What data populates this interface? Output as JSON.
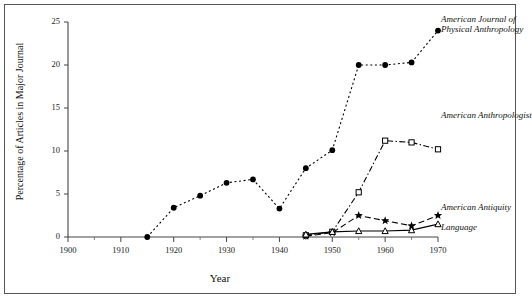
{
  "chart_data": {
    "type": "line",
    "title": "",
    "xlabel": "Year",
    "ylabel": "Percentage of Articles in Major Journal",
    "xlim": [
      1900,
      1970
    ],
    "ylim": [
      0,
      25
    ],
    "xticks": [
      1900,
      1910,
      1920,
      1930,
      1940,
      1950,
      1960,
      1970
    ],
    "xtick_labels": [
      "1900",
      "1910",
      "1920",
      "1930",
      "1940",
      "1950",
      "1960",
      "1970"
    ],
    "xminor_step": 5,
    "yticks": [
      0,
      5,
      10,
      15,
      20,
      25
    ],
    "ytick_labels": [
      "0",
      "5",
      "10",
      "15",
      "20",
      "25"
    ],
    "grid": false,
    "legend": "inline-right-labels",
    "series": [
      {
        "name": "American Journal of Physical Anthropology",
        "label_lines": [
          "American Journal of",
          "Physical Anthropology"
        ],
        "marker": "filled-circle",
        "linestyle": "dotted",
        "x": [
          1915,
          1920,
          1925,
          1930,
          1935,
          1940,
          1945,
          1950,
          1955,
          1960,
          1965,
          1970
        ],
        "y": [
          0,
          3.4,
          4.8,
          6.3,
          6.7,
          3.3,
          8.0,
          10.1,
          20.0,
          20.0,
          20.3,
          24.0
        ]
      },
      {
        "name": "American Anthropologist",
        "label_lines": [
          "American Anthropologist"
        ],
        "marker": "open-square",
        "linestyle": "dash-dot",
        "x": [
          1945,
          1950,
          1955,
          1960,
          1965,
          1970
        ],
        "y": [
          0.2,
          0.6,
          5.2,
          11.2,
          11.0,
          10.2
        ]
      },
      {
        "name": "American Antiquity",
        "label_lines": [
          "American Antiquity"
        ],
        "marker": "filled-star",
        "linestyle": "dashed",
        "x": [
          1945,
          1950,
          1955,
          1960,
          1965,
          1970
        ],
        "y": [
          0.1,
          0.5,
          2.5,
          1.9,
          1.3,
          2.5
        ]
      },
      {
        "name": "Language",
        "label_lines": [
          "Language"
        ],
        "marker": "open-triangle",
        "linestyle": "solid",
        "x": [
          1945,
          1950,
          1955,
          1960,
          1965,
          1970
        ],
        "y": [
          0.3,
          0.6,
          0.7,
          0.7,
          0.8,
          1.5
        ]
      }
    ]
  }
}
